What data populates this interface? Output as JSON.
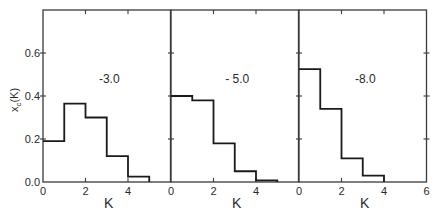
{
  "chart_data": {
    "type": "step",
    "title": "",
    "xlabel": "K",
    "ylabel": "x_c(K)",
    "ylabel_main": "x",
    "ylabel_sub": "c",
    "ylabel_arg": "(K)",
    "xlim": [
      0,
      6
    ],
    "ylim": [
      0,
      0.8
    ],
    "x_ticks": [
      0,
      2,
      4,
      6
    ],
    "x_tick_labels_panel": [
      "0",
      "2",
      "4"
    ],
    "x_tick_labels_last": [
      "0",
      "2",
      "4",
      "6"
    ],
    "y_ticks": [
      0.0,
      0.2,
      0.4,
      0.6
    ],
    "y_tick_labels": [
      "0.0",
      "0.2",
      "0.4",
      "0.6"
    ],
    "grid": false,
    "legend": null,
    "panels": [
      {
        "label": "-3.0",
        "bins": [
          [
            0,
            1
          ],
          [
            1,
            2
          ],
          [
            2,
            3
          ],
          [
            3,
            4
          ],
          [
            4,
            5
          ]
        ],
        "values": [
          0.19,
          0.365,
          0.3,
          0.12,
          0.025
        ]
      },
      {
        "label": "- 5.0",
        "bins": [
          [
            0,
            1
          ],
          [
            1,
            2
          ],
          [
            2,
            3
          ],
          [
            3,
            4
          ],
          [
            4,
            5
          ]
        ],
        "values": [
          0.4,
          0.38,
          0.18,
          0.05,
          0.008
        ]
      },
      {
        "label": "-8.0",
        "bins": [
          [
            0,
            1
          ],
          [
            1,
            2
          ],
          [
            2,
            3
          ],
          [
            3,
            4
          ]
        ],
        "values": [
          0.525,
          0.34,
          0.11,
          0.03
        ]
      }
    ]
  },
  "colors": {
    "line": "#1a1a1a",
    "frame": "#3a3a3a",
    "background": "#ffffff"
  }
}
